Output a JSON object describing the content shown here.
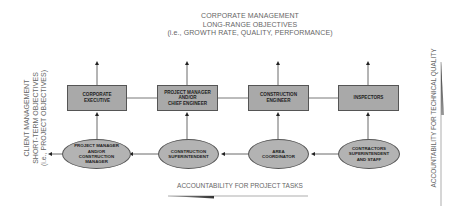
{
  "top_header": {
    "line1": "CORPORATE MANAGEMENT",
    "line2": "LONG-RANGE OBJECTIVES",
    "line3": "(i.e., GROWTH RATE, QUALITY, PERFORMANCE)"
  },
  "left_header": {
    "line1": "CLIENT MANAGEMENT",
    "line2": "SHORT-TERM OBJECTIVES",
    "line3": "(i.e., PROJECT OBJECTIVES)"
  },
  "right_axis_label": "ACCOUNTABILITY FOR TECHNICAL QUALITY",
  "bottom_axis_label": "ACCOUNTABILITY FOR PROJECT TASKS",
  "boxes": [
    {
      "line1": "CORPORATE",
      "line2": "EXECUTIVE",
      "line3": ""
    },
    {
      "line1": "PROJECT MANAGER",
      "line2": "AND/OR",
      "line3": "CHIEF ENGINEER"
    },
    {
      "line1": "CONSTRUCTION",
      "line2": "ENGINEER",
      "line3": ""
    },
    {
      "line1": "INSPECTORS",
      "line2": "",
      "line3": ""
    }
  ],
  "ellipses": [
    {
      "line1": "PROJECT MANAGER",
      "line2": "AND/OR",
      "line3": "CONSTRUCTION",
      "line4": "MANAGER"
    },
    {
      "line1": "CONSTRUCTION",
      "line2": "SUPERINTENDENT",
      "line3": "",
      "line4": ""
    },
    {
      "line1": "AREA",
      "line2": "COORDINATOR",
      "line3": "",
      "line4": ""
    },
    {
      "line1": "CONTRACTORS",
      "line2": "SUPERINTENDENT",
      "line3": "AND STAFF",
      "line4": ""
    }
  ]
}
